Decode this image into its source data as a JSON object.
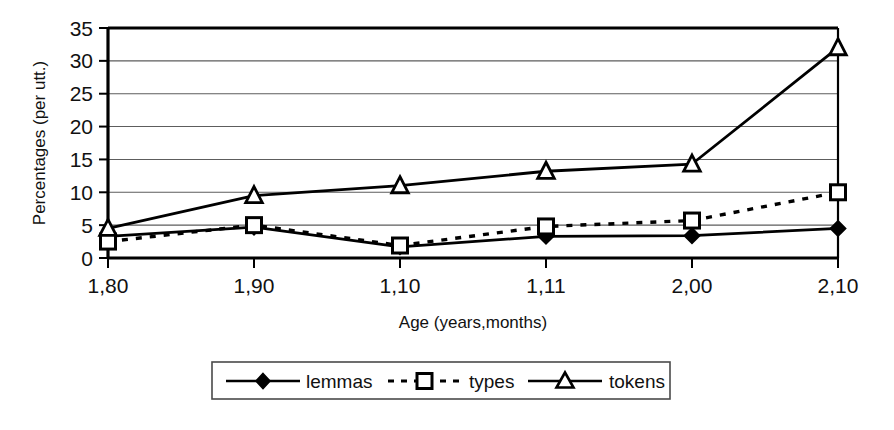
{
  "chart_data": {
    "type": "line",
    "title": "",
    "xlabel": "Age (years,months)",
    "ylabel": "Percentages (per utt.)",
    "categories": [
      "1,80",
      "1,90",
      "1,10",
      "1,11",
      "2,00",
      "2,10"
    ],
    "ylim": [
      0,
      35
    ],
    "yticks": [
      0,
      5,
      10,
      15,
      20,
      25,
      30,
      35
    ],
    "ytick_labels": [
      "0",
      "5",
      "10",
      "15",
      "20",
      "25",
      "30",
      "35"
    ],
    "grid": "horizontal",
    "legend_position": "bottom",
    "series": [
      {
        "name": "lemmas",
        "marker": "filled-diamond",
        "line": "solid",
        "color": "#000000",
        "values": [
          3.3,
          4.7,
          1.7,
          3.3,
          3.4,
          4.5
        ]
      },
      {
        "name": "types",
        "marker": "open-square",
        "line": "dashed",
        "color": "#000000",
        "values": [
          2.5,
          5.0,
          1.9,
          4.8,
          5.7,
          10.0
        ]
      },
      {
        "name": "tokens",
        "marker": "open-triangle",
        "line": "solid",
        "color": "#000000",
        "values": [
          4.5,
          9.5,
          11.0,
          13.2,
          14.3,
          32.0
        ]
      }
    ]
  },
  "axes": {
    "y_title": "Percentages (per utt.)",
    "x_title": "Age (years,months)",
    "y_tick_0": "0",
    "y_tick_1": "5",
    "y_tick_2": "10",
    "y_tick_3": "15",
    "y_tick_4": "20",
    "y_tick_5": "25",
    "y_tick_6": "30",
    "y_tick_7": "35",
    "x_tick_0": "1,80",
    "x_tick_1": "1,90",
    "x_tick_2": "1,10",
    "x_tick_3": "1,11",
    "x_tick_4": "2,00",
    "x_tick_5": "2,10"
  },
  "legend": {
    "item_0": "lemmas",
    "item_1": "types",
    "item_2": "tokens"
  },
  "colors": {
    "ink": "#000000",
    "grid": "#6b6b6b",
    "background": "#ffffff"
  }
}
